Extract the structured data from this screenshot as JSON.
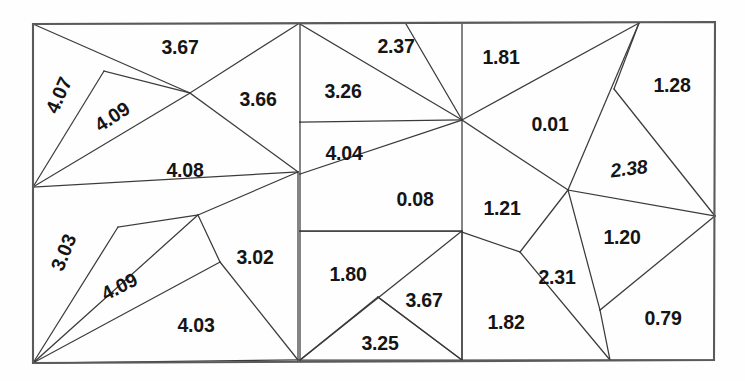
{
  "figure": {
    "name": "triangular-mesh-quality-diagram",
    "type": "mesh-diagram",
    "background_color": "#ffffff",
    "line_color": "#3b3b3b",
    "border_color": "#5a5a5a",
    "text_color": "#151515",
    "width": 745,
    "height": 381
  },
  "chart_data": {
    "type": "diagram",
    "title": "",
    "panels": [
      {
        "name": "left-panel",
        "x_range": [
          33,
          300
        ]
      },
      {
        "name": "middle-panel",
        "x_range": [
          300,
          462
        ]
      },
      {
        "name": "right-panel",
        "x_range": [
          462,
          715
        ]
      }
    ],
    "values": [
      4.07,
      3.67,
      3.66,
      4.09,
      4.08,
      3.03,
      4.09,
      3.02,
      4.03,
      2.37,
      1.81,
      3.26,
      4.04,
      0.08,
      1.8,
      3.67,
      3.25,
      1.28,
      0.01,
      2.38,
      1.21,
      1.2,
      2.31,
      1.82,
      0.79
    ],
    "value_count": 25,
    "min_value": 0.01,
    "max_value": 4.09
  },
  "mesh": {
    "outline": {
      "name": "domain-boundary",
      "points": "33,24 715,22 714,360 33,363"
    },
    "edges": [
      "33,24 190,93",
      "190,93 298,24",
      "33,187 104,71",
      "104,71 190,93",
      "33,187 190,93",
      "190,93 298,172",
      "33,187 298,172",
      "33,363 118,227",
      "118,227 198,215",
      "33,363 198,215",
      "198,215 298,172",
      "33,363 220,262",
      "220,262 198,215",
      "33,363 298,360",
      "298,360 220,262",
      "298,172 298,360",
      "300,24 300,122",
      "300,122 462,120",
      "300,122 300,174",
      "300,174 462,120",
      "300,24 462,120",
      "406,24 462,120",
      "462,24 462,120",
      "300,174 300,231",
      "300,231 462,231",
      "462,120 462,231",
      "300,231 462,231",
      "300,231 300,360",
      "300,360 462,231",
      "300,360 378,297",
      "378,297 462,360",
      "462,231 462,360",
      "462,360 378,297",
      "300,360 462,360",
      "462,120 639,23",
      "639,23 614,89",
      "614,89 715,216",
      "639,23 568,190",
      "462,120 568,190",
      "568,190 715,216",
      "568,190 600,310",
      "568,190 520,252",
      "520,252 610,360",
      "462,232 520,252",
      "462,232 462,360",
      "600,310 715,216",
      "600,310 610,360",
      "462,360 610,360",
      "610,360 714,360"
    ]
  },
  "labels": [
    {
      "name": "cell-value-4-07",
      "text": "4.07",
      "x": 60,
      "y": 96,
      "rotate": -66
    },
    {
      "name": "cell-value-3-67-a",
      "text": "3.67",
      "x": 180,
      "y": 49,
      "rotate": 0
    },
    {
      "name": "cell-value-4-09-a",
      "text": "4.09",
      "x": 113,
      "y": 118,
      "rotate": -33
    },
    {
      "name": "cell-value-3-66",
      "text": "3.66",
      "x": 258,
      "y": 101,
      "rotate": 0
    },
    {
      "name": "cell-value-4-08",
      "text": "4.08",
      "x": 185,
      "y": 172,
      "rotate": 0
    },
    {
      "name": "cell-value-3-03",
      "text": "3.03",
      "x": 65,
      "y": 253,
      "rotate": -68
    },
    {
      "name": "cell-value-4-09-b",
      "text": "4.09",
      "x": 120,
      "y": 288,
      "rotate": -27
    },
    {
      "name": "cell-value-3-02",
      "text": "3.02",
      "x": 255,
      "y": 259,
      "rotate": 0
    },
    {
      "name": "cell-value-4-03",
      "text": "4.03",
      "x": 196,
      "y": 327,
      "rotate": 0
    },
    {
      "name": "cell-value-2-37",
      "text": "2.37",
      "x": 396,
      "y": 48,
      "rotate": 0
    },
    {
      "name": "cell-value-1-81",
      "text": "1.81",
      "x": 501,
      "y": 59,
      "rotate": 0
    },
    {
      "name": "cell-value-3-26",
      "text": "3.26",
      "x": 343,
      "y": 93,
      "rotate": 0
    },
    {
      "name": "cell-value-4-04",
      "text": "4.04",
      "x": 344,
      "y": 155,
      "rotate": 0
    },
    {
      "name": "cell-value-0-08",
      "text": "0.08",
      "x": 415,
      "y": 201,
      "rotate": 0
    },
    {
      "name": "cell-value-1-80",
      "text": "1.80",
      "x": 348,
      "y": 276,
      "rotate": 0
    },
    {
      "name": "cell-value-3-67-b",
      "text": "3.67",
      "x": 424,
      "y": 302,
      "rotate": 0
    },
    {
      "name": "cell-value-3-25",
      "text": "3.25",
      "x": 380,
      "y": 345,
      "rotate": 0
    },
    {
      "name": "cell-value-1-28",
      "text": "1.28",
      "x": 672,
      "y": 87,
      "rotate": 0
    },
    {
      "name": "cell-value-0-01",
      "text": "0.01",
      "x": 550,
      "y": 126,
      "rotate": 0
    },
    {
      "name": "cell-value-2-38",
      "text": "2.38",
      "x": 629,
      "y": 170,
      "rotate": -7
    },
    {
      "name": "cell-value-1-21",
      "text": "1.21",
      "x": 502,
      "y": 210,
      "rotate": 0
    },
    {
      "name": "cell-value-1-20",
      "text": "1.20",
      "x": 622,
      "y": 239,
      "rotate": 0
    },
    {
      "name": "cell-value-2-31",
      "text": "2.31",
      "x": 557,
      "y": 279,
      "rotate": 0
    },
    {
      "name": "cell-value-1-82",
      "text": "1.82",
      "x": 506,
      "y": 324,
      "rotate": 0
    },
    {
      "name": "cell-value-0-79",
      "text": "0.79",
      "x": 663,
      "y": 320,
      "rotate": 0
    }
  ]
}
